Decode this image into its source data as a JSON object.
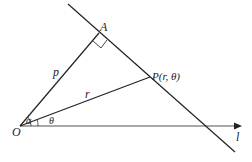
{
  "diagram": {
    "type": "geometry-polar-line",
    "points": {
      "O": {
        "label": "O",
        "x": 20,
        "y": 126
      },
      "A": {
        "label": "A",
        "x": 100,
        "y": 33
      },
      "P": {
        "label": "P(r, θ)",
        "x": 150,
        "y": 77
      }
    },
    "segments": {
      "OA": {
        "label": "p"
      },
      "OP": {
        "label": "r"
      }
    },
    "angles": {
      "alpha": {
        "label": "α"
      },
      "theta": {
        "label": "θ"
      }
    },
    "axis": {
      "label": "l"
    },
    "colors": {
      "line": "#222222",
      "axis": "#555555"
    }
  }
}
